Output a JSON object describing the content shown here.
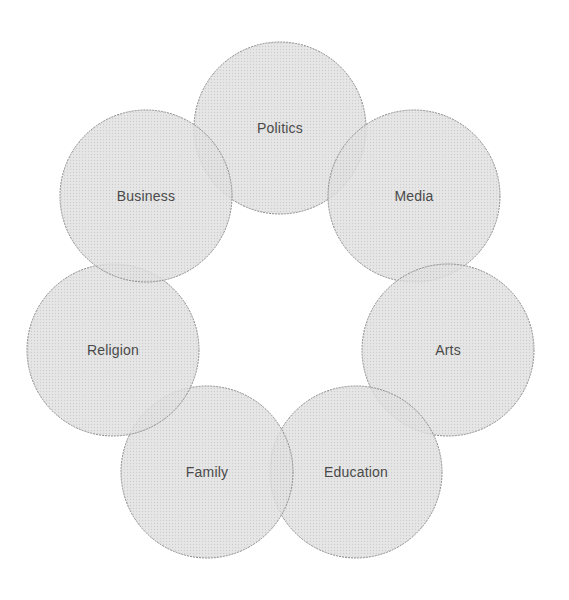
{
  "diagram": {
    "type": "ring-of-overlapping-circles",
    "style": {
      "fill": "#dcdcdc",
      "stroke": "#8a8a8a",
      "text_color": "#4a4a4a",
      "background": "#ffffff"
    },
    "circles": [
      {
        "label": "Politics",
        "cx": 280,
        "cy": 128,
        "r": 86
      },
      {
        "label": "Media",
        "cx": 414,
        "cy": 196,
        "r": 86
      },
      {
        "label": "Arts",
        "cx": 448,
        "cy": 350,
        "r": 86
      },
      {
        "label": "Education",
        "cx": 356,
        "cy": 472,
        "r": 86
      },
      {
        "label": "Family",
        "cx": 207,
        "cy": 472,
        "r": 86
      },
      {
        "label": "Religion",
        "cx": 113,
        "cy": 350,
        "r": 86
      },
      {
        "label": "Business",
        "cx": 146,
        "cy": 196,
        "r": 86
      }
    ]
  }
}
